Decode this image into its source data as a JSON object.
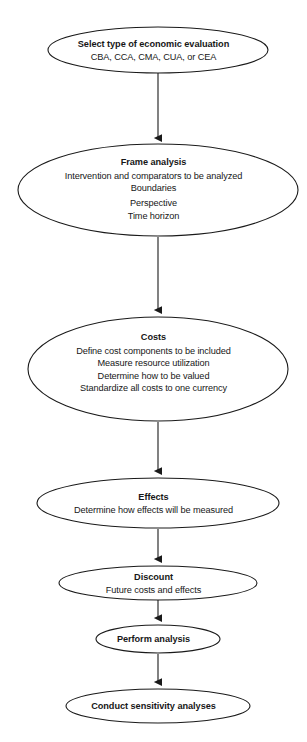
{
  "diagram": {
    "background_color": "#ffffff",
    "stroke_color": "#1a1a1a",
    "text_color": "#171717",
    "node_shape": "ellipse",
    "connector": "downward-arrow",
    "nodes": [
      {
        "id": "select-type",
        "title": "Select type of economic evaluation",
        "lines": [
          "CBA, CCA, CMA, CUA, or CEA"
        ],
        "cx": 158,
        "cy": 50,
        "rx": 110,
        "ry": 23
      },
      {
        "id": "frame-analysis",
        "title": "Frame analysis",
        "lines": [
          "Intervention and comparators to be analyzed",
          "Boundaries",
          "Perspective",
          "Time horizon"
        ],
        "cx": 158,
        "cy": 190,
        "rx": 140,
        "ry": 46
      },
      {
        "id": "costs",
        "title": "Costs",
        "lines": [
          "Define cost components to be included",
          "Measure resource utilization",
          "Determine how to be valued",
          "Standardize all costs to one currency"
        ],
        "cx": 158,
        "cy": 369,
        "rx": 130,
        "ry": 52
      },
      {
        "id": "effects",
        "title": "Effects",
        "lines": [
          "Determine how effects will be measured"
        ],
        "cx": 158,
        "cy": 503,
        "rx": 121,
        "ry": 25
      },
      {
        "id": "discount",
        "title": "Discount",
        "lines": [
          "Future costs and effects"
        ],
        "cx": 158,
        "cy": 583,
        "rx": 99,
        "ry": 17
      },
      {
        "id": "perform-analysis",
        "title": "Perform analysis",
        "lines": [],
        "cx": 158,
        "cy": 639,
        "rx": 62,
        "ry": 14
      },
      {
        "id": "conduct-sensitivity",
        "title": "Conduct sensitivity analyses",
        "lines": [],
        "cx": 158,
        "cy": 706,
        "rx": 92,
        "ry": 17
      }
    ],
    "arrows": [
      {
        "id": "arrow-1",
        "from": "select-type",
        "to": "frame-analysis",
        "x": 158,
        "y1": 73,
        "y2": 144
      },
      {
        "id": "arrow-2",
        "from": "frame-analysis",
        "to": "costs",
        "x": 158,
        "y1": 237,
        "y2": 316
      },
      {
        "id": "arrow-3",
        "from": "costs",
        "to": "effects",
        "x": 158,
        "y1": 422,
        "y2": 477
      },
      {
        "id": "arrow-4",
        "from": "effects",
        "to": "discount",
        "x": 158,
        "y1": 529,
        "y2": 565
      },
      {
        "id": "arrow-5",
        "from": "discount",
        "to": "perform-analysis",
        "x": 158,
        "y1": 600,
        "y2": 624
      },
      {
        "id": "arrow-6",
        "from": "perform-analysis",
        "to": "conduct-sensitivity",
        "x": 158,
        "y1": 654,
        "y2": 688
      }
    ]
  }
}
